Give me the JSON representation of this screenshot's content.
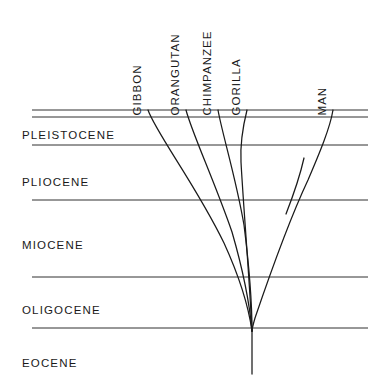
{
  "figure": {
    "kind": "phylogenetic-tree-diagram",
    "background_color": "#ffffff",
    "line_color": "#1a1a1a",
    "text_color": "#1a1a1a",
    "width": 392,
    "height": 388
  },
  "epochs": [
    {
      "label": "PLEISTOCENE",
      "x": 22,
      "y": 130
    },
    {
      "label": "PLIOCENE",
      "x": 22,
      "y": 177
    },
    {
      "label": "MIOCENE",
      "x": 22,
      "y": 240
    },
    {
      "label": "OLIGOCENE",
      "x": 22,
      "y": 305
    },
    {
      "label": "EOCENE",
      "x": 22,
      "y": 358
    }
  ],
  "epoch_boundaries": [
    {
      "name": "top-border",
      "y": 110,
      "x1": 32,
      "x2": 368
    },
    {
      "name": "pleistocene-top",
      "y": 117,
      "x1": 32,
      "x2": 368
    },
    {
      "name": "pleistocene-pliocene",
      "y": 145,
      "x1": 32,
      "x2": 368
    },
    {
      "name": "pliocene-miocene",
      "y": 200,
      "x1": 32,
      "x2": 368
    },
    {
      "name": "miocene-oligocene",
      "y": 277,
      "x1": 32,
      "x2": 368
    },
    {
      "name": "oligocene-eocene",
      "y": 328,
      "x1": 32,
      "x2": 368
    }
  ],
  "taxa": [
    {
      "label": "GIBBON",
      "tip_x": 148,
      "label_x": 143,
      "label_baseline_y": 104
    },
    {
      "label": "ORANGUTAN",
      "tip_x": 186,
      "label_x": 181,
      "label_baseline_y": 104
    },
    {
      "label": "CHIMPANZEE",
      "tip_x": 218,
      "label_x": 213,
      "label_baseline_y": 104
    },
    {
      "label": "GORILLA",
      "tip_x": 247,
      "label_x": 242,
      "label_baseline_y": 104
    },
    {
      "label": "MAN",
      "tip_x": 333,
      "label_x": 328,
      "label_baseline_y": 104
    }
  ],
  "root": {
    "x": 252,
    "y": 330,
    "trunk_bottom_y": 374
  },
  "branches": [
    {
      "name": "gibbon-lineage",
      "path": "M 148 110 C 156 133, 196 185, 224 243 C 240 278, 249 310, 252 331"
    },
    {
      "name": "orangutan-lineage",
      "path": "M 186 110 C 192 133, 214 180, 232 232 C 243 270, 250 308, 252 331"
    },
    {
      "name": "chimpanzee-lineage",
      "path": "M 218 110 C 222 133, 236 178, 244 225 C 249 265, 252 305, 252 331"
    },
    {
      "name": "gorilla-lineage",
      "path": "M 247 110 C 243 126, 240 143, 241 162 C 243 200, 249 272, 252 331"
    },
    {
      "name": "man-lineage",
      "path": "M 333 110 C 330 128, 320 152, 308 180 C 292 214, 270 274, 255 318 C 253 325, 252 329, 252 331"
    },
    {
      "name": "extinct-side-branch",
      "path": "M 304 158 C 300 176, 293 196, 286 214"
    },
    {
      "name": "root-trunk",
      "path": "M 252 331 L 252 374"
    }
  ]
}
